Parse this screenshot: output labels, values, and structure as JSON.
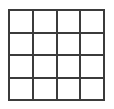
{
  "figure": {
    "name": "square-grid",
    "rows": 4,
    "columns": 4,
    "cell_count": 16,
    "line_color": "#3b3b3b",
    "line_width_px": 2,
    "cell_fill_color": "#ffffff",
    "background_color": "#ffffff",
    "outer_border": true,
    "bounds": {
      "left_px": 8,
      "top_px": 9,
      "width_px": 97,
      "height_px": 92
    },
    "cells": [
      {
        "row": 1,
        "col": 1,
        "label": ""
      },
      {
        "row": 1,
        "col": 2,
        "label": ""
      },
      {
        "row": 1,
        "col": 3,
        "label": ""
      },
      {
        "row": 1,
        "col": 4,
        "label": ""
      },
      {
        "row": 2,
        "col": 1,
        "label": ""
      },
      {
        "row": 2,
        "col": 2,
        "label": ""
      },
      {
        "row": 2,
        "col": 3,
        "label": ""
      },
      {
        "row": 2,
        "col": 4,
        "label": ""
      },
      {
        "row": 3,
        "col": 1,
        "label": ""
      },
      {
        "row": 3,
        "col": 2,
        "label": ""
      },
      {
        "row": 3,
        "col": 3,
        "label": ""
      },
      {
        "row": 3,
        "col": 4,
        "label": ""
      },
      {
        "row": 4,
        "col": 1,
        "label": ""
      },
      {
        "row": 4,
        "col": 2,
        "label": ""
      },
      {
        "row": 4,
        "col": 3,
        "label": ""
      },
      {
        "row": 4,
        "col": 4,
        "label": ""
      }
    ]
  }
}
